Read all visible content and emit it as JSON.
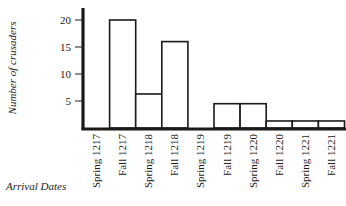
{
  "chart_data": {
    "type": "bar",
    "title": "",
    "xlabel": "Arrival Dates",
    "ylabel": "Number of crusaders",
    "categories": [
      "Spring 1217",
      "Fall 1217",
      "Spring 1218",
      "Fall 1218",
      "Spring 1219",
      "Fall 1219",
      "Spring 1220",
      "Fall 1220",
      "Spring 1221",
      "Fall 1221"
    ],
    "values": [
      0,
      20,
      6.3,
      16,
      0,
      4.5,
      4.5,
      1.3,
      1.3,
      1.3
    ],
    "yticks": [
      5,
      10,
      15,
      20
    ],
    "ylim": [
      0,
      21.5
    ],
    "grid": false,
    "legend": null
  },
  "labels": {
    "ylabel": "Number of crusaders",
    "xlabel": "Arrival Dates"
  }
}
